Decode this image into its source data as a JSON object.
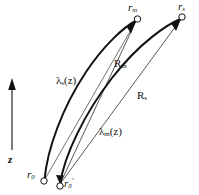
{
  "figure": {
    "background_color": "#ffffff",
    "line_color": "#111111",
    "width": 199,
    "height": 195
  },
  "axis": {
    "name": "z-axis",
    "label": "z",
    "direction": "up",
    "arrow_tip_y": 82,
    "arrow_base_y": 150,
    "x": 12
  },
  "points": [
    {
      "id": "r_m",
      "symbol": "r",
      "subscript": "m",
      "prime": "",
      "marker": "open-circle",
      "position": {
        "x": 137,
        "y": 19
      },
      "role": "upper-receiver-m"
    },
    {
      "id": "r_s",
      "symbol": "r",
      "subscript": "s",
      "prime": "",
      "marker": "open-circle",
      "position": {
        "x": 182,
        "y": 17
      },
      "role": "upper-receiver-s"
    },
    {
      "id": "r_0",
      "symbol": "r",
      "subscript": "0",
      "prime": "",
      "marker": "open-circle",
      "position": {
        "x": 44,
        "y": 180
      },
      "role": "lower-source"
    },
    {
      "id": "r_0_prime",
      "symbol": "r",
      "subscript": "0",
      "prime": "′",
      "marker": "open-circle",
      "position": {
        "x": 60,
        "y": 185
      },
      "role": "lower-source-prime"
    }
  ],
  "labels": {
    "r_m": {
      "base": "r",
      "sub": "m"
    },
    "r_s": {
      "base": "r",
      "sub": "s"
    },
    "r_0": {
      "base": "r",
      "sub": "0"
    },
    "r_0_prime": {
      "base": "r",
      "sub": "0",
      "prime": "′"
    },
    "lambda_s": {
      "base": "λ",
      "sub": "s",
      "arg": "(z)"
    },
    "lambda_m": {
      "base": "λ",
      "sub": "m",
      "arg": "(z)"
    },
    "R_m": {
      "base": "R",
      "sub": "m"
    },
    "R_s": {
      "base": "R",
      "sub": "s"
    },
    "z": "z"
  },
  "paths": [
    {
      "id": "lambda_s_path",
      "label": "λₛ(z)",
      "style": "curved-bold",
      "from": "r_0",
      "to": "r_m",
      "stroke_width": 2.0
    },
    {
      "id": "lambda_m_path",
      "label": "λₘ(z)",
      "style": "curved-bold",
      "from": "r_0_prime",
      "to": "r_s",
      "stroke_width": 2.0
    },
    {
      "id": "R_m_line",
      "label": "Rₘ",
      "style": "straight-thin",
      "from": "r_0_prime",
      "to": "r_m",
      "stroke_width": 0.7
    },
    {
      "id": "R_s_line",
      "label": "Rₛ",
      "style": "straight-thin",
      "from": "r_0_prime",
      "to": "r_s",
      "stroke_width": 0.7
    }
  ]
}
